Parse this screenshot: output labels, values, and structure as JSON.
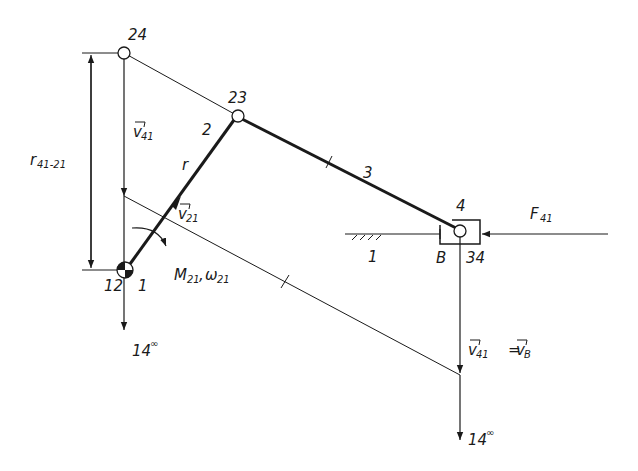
{
  "diagram": {
    "type": "slider-crank velocity/force diagram",
    "colors": {
      "line": "#1a1a1a",
      "background": "#ffffff"
    },
    "nodes": {
      "n24": {
        "label": "24",
        "x": 124,
        "y": 53
      },
      "n23": {
        "label": "23",
        "x": 238,
        "y": 116
      },
      "n12": {
        "label": "12",
        "x": 125,
        "y": 270
      },
      "n34": {
        "label": "34",
        "x": 460,
        "y": 231
      }
    },
    "links": {
      "link2": {
        "label": "2",
        "radius_label": "r"
      },
      "link3": {
        "label": "3"
      },
      "slider": {
        "label": "4"
      },
      "ground_left": {
        "label": "1"
      },
      "ground_right": {
        "label": "1"
      }
    },
    "labels": {
      "crank_pivot": "1",
      "slider_point": "B",
      "dimension": {
        "main": "r",
        "sub": "41-21"
      },
      "v41_top": {
        "main": "v",
        "sub": "41"
      },
      "v21": {
        "main": "v",
        "sub": "21"
      },
      "moment": {
        "main1": "M",
        "sub1": "21",
        "sep": ",",
        "main2": "ω",
        "sub2": "21"
      },
      "v41_bottom": {
        "main": "v",
        "sub": "41"
      },
      "vB": {
        "eq": "=",
        "main": "v",
        "sub": "B"
      },
      "force": {
        "main": "F",
        "sub": "41"
      },
      "pole_left": {
        "main": "14",
        "sup": "∞"
      },
      "pole_right": {
        "main": "14",
        "sup": "∞"
      }
    }
  }
}
